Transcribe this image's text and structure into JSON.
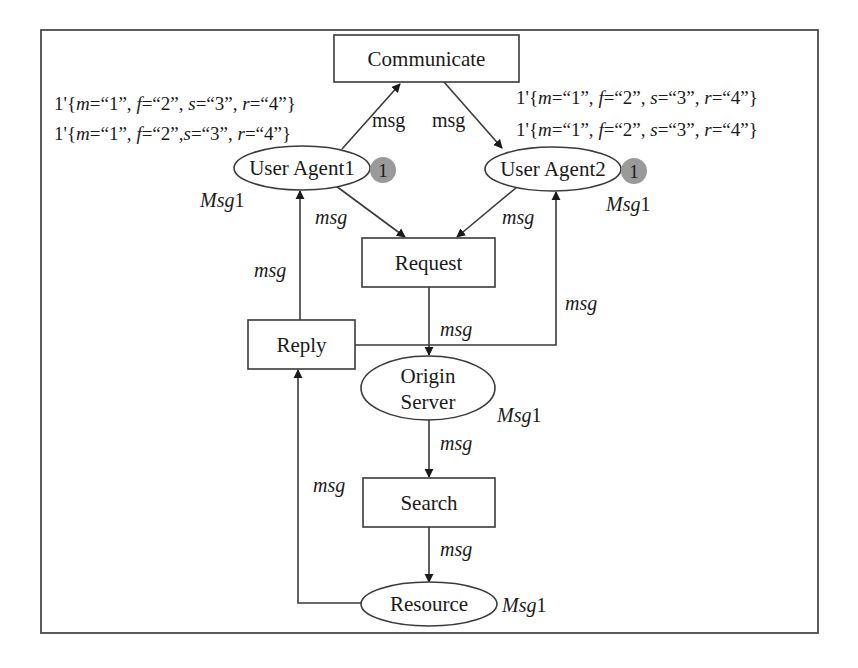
{
  "diagram": {
    "type": "colored-petri-net",
    "places": [
      {
        "id": "ua1",
        "label": "User Agent1",
        "color_set": "Msg1",
        "token_count": "1",
        "marking_lines": [
          {
            "prefix": "1'{",
            "parts": [
              [
                "m",
                "=“1”, "
              ],
              [
                "f",
                "=“2”, "
              ],
              [
                "s",
                "=“3”, "
              ],
              [
                "r",
                "=“4”"
              ]
            ],
            "suffix": "}"
          },
          {
            "prefix": "1'{",
            "parts": [
              [
                "m",
                "=“1”, "
              ],
              [
                "f",
                "=“2”,"
              ],
              [
                "s",
                "=“3”, "
              ],
              [
                "r",
                "=“4”"
              ]
            ],
            "suffix": "}"
          }
        ]
      },
      {
        "id": "ua2",
        "label": "User Agent2",
        "color_set": "Msg1",
        "token_count": "1",
        "marking_lines": [
          {
            "prefix": "1'{",
            "parts": [
              [
                "m",
                "=“1”, "
              ],
              [
                "f",
                "=“2”, "
              ],
              [
                "s",
                "=“3”, "
              ],
              [
                "r",
                "=“4”"
              ]
            ],
            "suffix": "}"
          },
          {
            "prefix": "1'{",
            "parts": [
              [
                "m",
                "=“1”, "
              ],
              [
                "f",
                "=“2”, "
              ],
              [
                "s",
                "=“3”, "
              ],
              [
                "r",
                "=“4”"
              ]
            ],
            "suffix": "}"
          }
        ]
      },
      {
        "id": "origin",
        "label_line1": "Origin",
        "label_line2": "Server",
        "color_set": "Msg1"
      },
      {
        "id": "resource",
        "label": "Resource",
        "color_set": "Msg1"
      }
    ],
    "transitions": [
      {
        "id": "communicate",
        "label": "Communicate"
      },
      {
        "id": "request",
        "label": "Request"
      },
      {
        "id": "reply",
        "label": "Reply"
      },
      {
        "id": "search",
        "label": "Search"
      }
    ],
    "arcs": [
      {
        "from": "ua1",
        "to": "communicate",
        "inscription": "msg",
        "italic": false
      },
      {
        "from": "communicate",
        "to": "ua2",
        "inscription": "msg",
        "italic": false
      },
      {
        "from": "ua1",
        "to": "request",
        "inscription": "msg",
        "italic": true
      },
      {
        "from": "ua2",
        "to": "request",
        "inscription": "msg",
        "italic": true
      },
      {
        "from": "reply",
        "to": "ua1",
        "inscription": "msg",
        "italic": true
      },
      {
        "from": "reply",
        "to": "ua2",
        "inscription": "msg",
        "italic": true
      },
      {
        "from": "request",
        "to": "origin",
        "inscription": "msg",
        "italic": true
      },
      {
        "from": "origin",
        "to": "search",
        "inscription": "msg",
        "italic": true
      },
      {
        "from": "search",
        "to": "resource",
        "inscription": "msg",
        "italic": true
      },
      {
        "from": "resource",
        "to": "reply",
        "inscription": "msg",
        "italic": true
      }
    ],
    "colors": {
      "line": "#3a3a3a",
      "text": "#1a1a1a",
      "token_fill": "#9a9a9a",
      "background": "#ffffff"
    }
  },
  "labels": {
    "communicate": "Communicate",
    "request": "Request",
    "reply": "Reply",
    "search": "Search",
    "ua1": "User Agent1",
    "ua2": "User Agent2",
    "origin_1": "Origin",
    "origin_2": "Server",
    "resource": "Resource",
    "token_ua1": "1",
    "token_ua2": "1",
    "msg": "msg",
    "colorset_prefix": "Msg",
    "colorset_suffix": "1",
    "mark_prefix": "1'{",
    "mark_suffix": "}",
    "m": "m",
    "f": "f",
    "s": "s",
    "r": "r",
    "v1c": "=“1”, ",
    "v1": "=“1”, ",
    "v2c": "=“2”, ",
    "v2nc": "=“2”,",
    "v3c": "=“3”, ",
    "v4": "=“4”"
  }
}
